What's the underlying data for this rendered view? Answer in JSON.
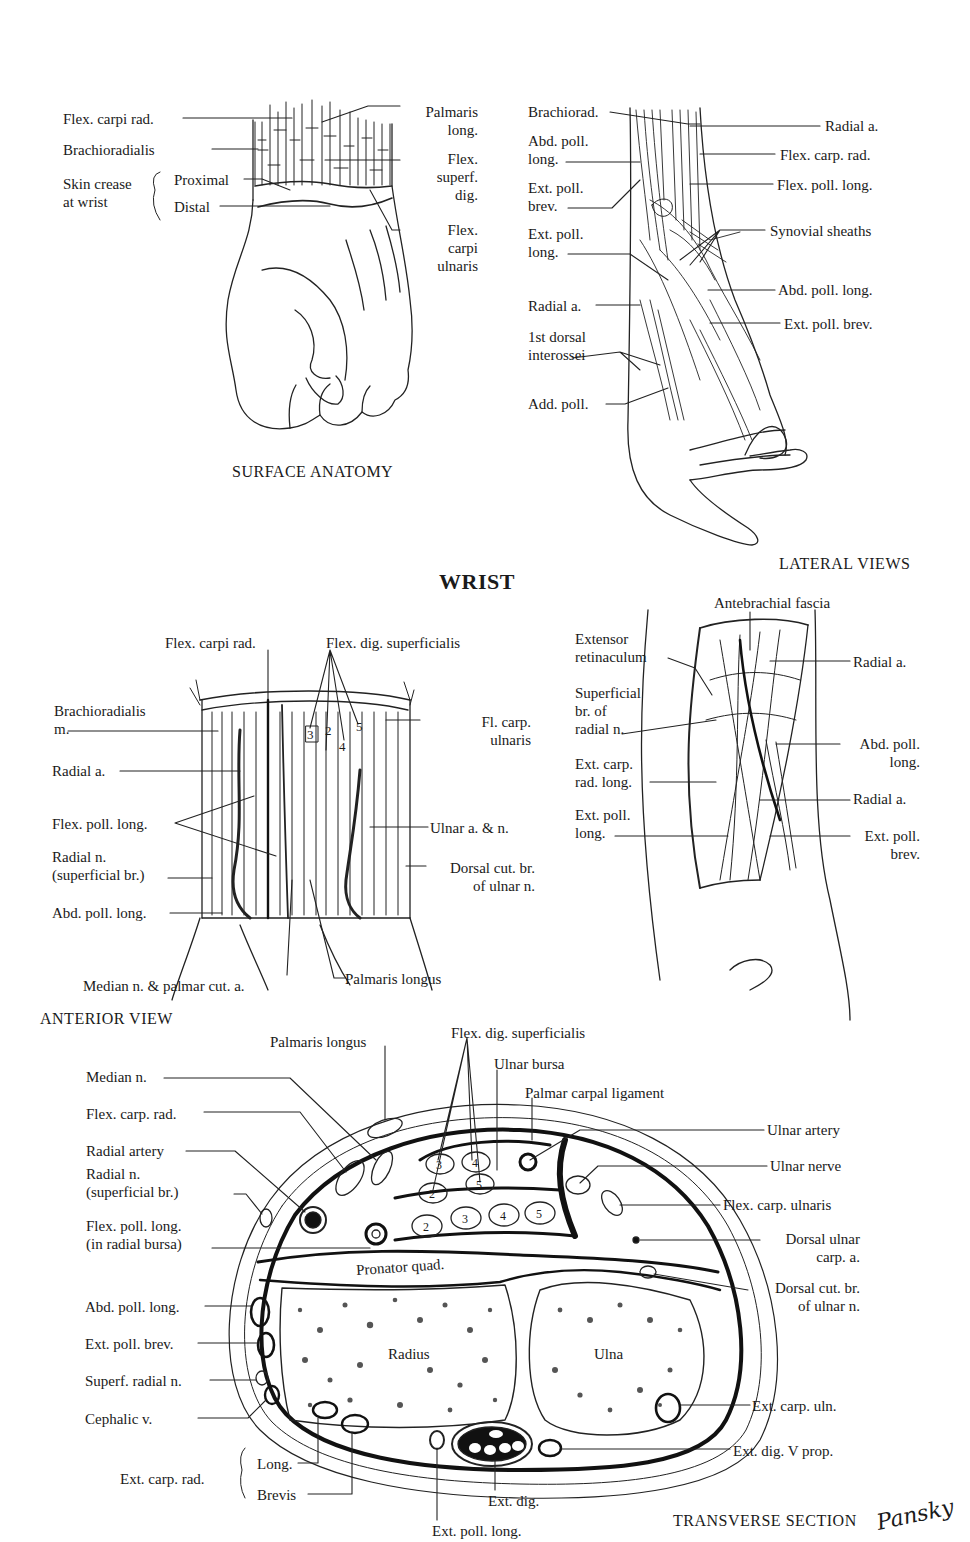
{
  "title": "WRIST",
  "panels": {
    "surface_anatomy": {
      "caption": "SURFACE ANATOMY",
      "labels": [
        {
          "id": "flex-carpi-rad",
          "text": "Flex. carpi rad.",
          "x": 63,
          "y": 110,
          "align": "left"
        },
        {
          "id": "brachioradialis",
          "text": "Brachioradialis",
          "x": 63,
          "y": 141,
          "align": "left"
        },
        {
          "id": "skin-crease",
          "text": "Skin crease\nat wrist",
          "x": 63,
          "y": 175,
          "align": "left"
        },
        {
          "id": "proximal",
          "text": "Proximal",
          "x": 174,
          "y": 171,
          "align": "left"
        },
        {
          "id": "distal",
          "text": "Distal",
          "x": 174,
          "y": 198,
          "align": "left"
        },
        {
          "id": "palmaris-long",
          "text": "Palmaris\nlong.",
          "x": 402,
          "y": 103,
          "align": "right",
          "w": 76
        },
        {
          "id": "flex-superf-dig",
          "text": "Flex.\nsuperf.\ndig.",
          "x": 402,
          "y": 150,
          "align": "right",
          "w": 76
        },
        {
          "id": "flex-carpi-ulnaris",
          "text": "Flex.\ncarpi\nulnaris",
          "x": 402,
          "y": 221,
          "align": "right",
          "w": 76
        }
      ]
    },
    "lateral_views": {
      "caption": "LATERAL VIEWS",
      "upper_labels": [
        {
          "id": "brachiorad",
          "text": "Brachiorad.",
          "x": 528,
          "y": 103,
          "align": "left"
        },
        {
          "id": "abd-poll-long-1",
          "text": "Abd. poll.\nlong.",
          "x": 528,
          "y": 132,
          "align": "left"
        },
        {
          "id": "ext-poll-brev-1",
          "text": "Ext. poll.\nbrev.",
          "x": 528,
          "y": 179,
          "align": "left"
        },
        {
          "id": "ext-poll-long-1",
          "text": "Ext. poll.\nlong.",
          "x": 528,
          "y": 225,
          "align": "left"
        },
        {
          "id": "radial-a-left",
          "text": "Radial a.",
          "x": 528,
          "y": 297,
          "align": "left"
        },
        {
          "id": "first-dorsal-interossei",
          "text": "1st dorsal\ninterossei",
          "x": 528,
          "y": 328,
          "align": "left"
        },
        {
          "id": "add-poll",
          "text": "Add. poll.",
          "x": 528,
          "y": 395,
          "align": "left"
        },
        {
          "id": "radial-a-right",
          "text": "Radial a.",
          "x": 825,
          "y": 117,
          "align": "left"
        },
        {
          "id": "flex-carp-rad-1",
          "text": "Flex. carp. rad.",
          "x": 780,
          "y": 146,
          "align": "left"
        },
        {
          "id": "flex-poll-long-1",
          "text": "Flex. poll. long.",
          "x": 777,
          "y": 176,
          "align": "left"
        },
        {
          "id": "synovial-sheaths",
          "text": "Synovial sheaths",
          "x": 770,
          "y": 222,
          "align": "left"
        },
        {
          "id": "abd-poll-long-2",
          "text": "Abd. poll. long.",
          "x": 778,
          "y": 281,
          "align": "left"
        },
        {
          "id": "ext-poll-brev-2",
          "text": "Ext. poll. brev.",
          "x": 784,
          "y": 315,
          "align": "left"
        }
      ],
      "lower_labels": [
        {
          "id": "antebrachial-fascia",
          "text": "Antebrachial fascia",
          "x": 714,
          "y": 594,
          "align": "left"
        },
        {
          "id": "extensor-retinaculum",
          "text": "Extensor\nretinaculum",
          "x": 575,
          "y": 630,
          "align": "left"
        },
        {
          "id": "superficial-br-radial-n",
          "text": "Superficial\nbr. of\nradial n.",
          "x": 575,
          "y": 684,
          "align": "left"
        },
        {
          "id": "ext-carp-rad-long",
          "text": "Ext. carp.\nrad. long.",
          "x": 575,
          "y": 755,
          "align": "left"
        },
        {
          "id": "ext-poll-long-2",
          "text": "Ext. poll.\nlong.",
          "x": 575,
          "y": 806,
          "align": "left"
        },
        {
          "id": "radial-a-3",
          "text": "Radial a.",
          "x": 853,
          "y": 653,
          "align": "left"
        },
        {
          "id": "abd-poll-long-3",
          "text": "Abd. poll.\nlong.",
          "x": 840,
          "y": 735,
          "align": "right",
          "w": 80
        },
        {
          "id": "radial-a-4",
          "text": "Radial a.",
          "x": 853,
          "y": 790,
          "align": "left"
        },
        {
          "id": "ext-poll-brev-3",
          "text": "Ext. poll.\nbrev.",
          "x": 840,
          "y": 827,
          "align": "right",
          "w": 80
        }
      ]
    },
    "anterior_view": {
      "caption": "ANTERIOR VIEW",
      "tendon_numbers": [
        "3",
        "2",
        "4",
        "5"
      ],
      "labels": [
        {
          "id": "flex-carpi-rad-2",
          "text": "Flex. carpi rad.",
          "x": 165,
          "y": 634,
          "align": "left"
        },
        {
          "id": "flex-dig-superficialis",
          "text": "Flex. dig. superficialis",
          "x": 326,
          "y": 634,
          "align": "left"
        },
        {
          "id": "brachioradialis-m",
          "text": "Brachioradialis\nm.",
          "x": 54,
          "y": 702,
          "align": "left"
        },
        {
          "id": "radial-a-5",
          "text": "Radial a.",
          "x": 52,
          "y": 762,
          "align": "left"
        },
        {
          "id": "flex-poll-long-2",
          "text": "Flex. poll. long.",
          "x": 52,
          "y": 815,
          "align": "left"
        },
        {
          "id": "radial-n-superficial",
          "text": "Radial n.\n(superficial br.)",
          "x": 52,
          "y": 848,
          "align": "left"
        },
        {
          "id": "abd-poll-long-4",
          "text": "Abd. poll. long.",
          "x": 52,
          "y": 904,
          "align": "left"
        },
        {
          "id": "median-n-palmar",
          "text": "Median n. & palmar cut. a.",
          "x": 83,
          "y": 977,
          "align": "left"
        },
        {
          "id": "palmaris-longus",
          "text": "Palmaris longus",
          "x": 345,
          "y": 970,
          "align": "left"
        },
        {
          "id": "fl-carp-ulnaris",
          "text": "Fl. carp.\nulnaris",
          "x": 455,
          "y": 713,
          "align": "right",
          "w": 76
        },
        {
          "id": "ulnar-a-n",
          "text": "Ulnar a. & n.",
          "x": 430,
          "y": 819,
          "align": "left"
        },
        {
          "id": "dorsal-cut-br-ulnar-1",
          "text": "Dorsal cut. br.\nof ulnar n.",
          "x": 420,
          "y": 859,
          "align": "right",
          "w": 115
        }
      ]
    },
    "transverse_section": {
      "caption": "TRANSVERSE SECTION",
      "signature": "Pansky",
      "bone_labels": {
        "pronator": "Pronator quad.",
        "radius": "Radius",
        "ulna": "Ulna"
      },
      "tendon_numbers_upper": [
        "3",
        "4",
        "2",
        "5"
      ],
      "tendon_numbers_lower": [
        "2",
        "3",
        "4",
        "5"
      ],
      "labels": [
        {
          "id": "palmaris-longus-2",
          "text": "Palmaris longus",
          "x": 270,
          "y": 1033,
          "align": "left"
        },
        {
          "id": "flex-dig-superficialis-2",
          "text": "Flex. dig. superficialis",
          "x": 451,
          "y": 1024,
          "align": "left"
        },
        {
          "id": "ulnar-bursa",
          "text": "Ulnar bursa",
          "x": 494,
          "y": 1055,
          "align": "left"
        },
        {
          "id": "palmar-carpal-ligament",
          "text": "Palmar carpal ligament",
          "x": 525,
          "y": 1084,
          "align": "left"
        },
        {
          "id": "median-n",
          "text": "Median n.",
          "x": 86,
          "y": 1068,
          "align": "left"
        },
        {
          "id": "flex-carp-rad-3",
          "text": "Flex. carp. rad.",
          "x": 86,
          "y": 1105,
          "align": "left"
        },
        {
          "id": "radial-artery",
          "text": "Radial artery",
          "x": 86,
          "y": 1142,
          "align": "left"
        },
        {
          "id": "radial-n-superficial-2",
          "text": "Radial n.\n(superficial br.)",
          "x": 86,
          "y": 1165,
          "align": "left"
        },
        {
          "id": "flex-poll-long-radial-bursa",
          "text": "Flex. poll. long.\n(in radial bursa)",
          "x": 86,
          "y": 1217,
          "align": "left"
        },
        {
          "id": "abd-poll-long-5",
          "text": "Abd. poll. long.",
          "x": 85,
          "y": 1298,
          "align": "left"
        },
        {
          "id": "ext-poll-brev-4",
          "text": "Ext. poll. brev.",
          "x": 85,
          "y": 1335,
          "align": "left"
        },
        {
          "id": "superf-radial-n",
          "text": "Superf. radial n.",
          "x": 85,
          "y": 1372,
          "align": "left"
        },
        {
          "id": "cephalic-v",
          "text": "Cephalic v.",
          "x": 85,
          "y": 1410,
          "align": "left"
        },
        {
          "id": "ext-carp-rad",
          "text": "Ext. carp. rad.",
          "x": 120,
          "y": 1470,
          "align": "left"
        },
        {
          "id": "long",
          "text": "Long.",
          "x": 257,
          "y": 1455,
          "align": "left"
        },
        {
          "id": "brevis",
          "text": "Brevis",
          "x": 257,
          "y": 1486,
          "align": "left"
        },
        {
          "id": "ext-poll-long-3",
          "text": "Ext. poll. long.",
          "x": 432,
          "y": 1522,
          "align": "left"
        },
        {
          "id": "ext-dig",
          "text": "Ext. dig.",
          "x": 488,
          "y": 1492,
          "align": "left"
        },
        {
          "id": "ulnar-artery",
          "text": "Ulnar artery",
          "x": 767,
          "y": 1121,
          "align": "left"
        },
        {
          "id": "ulnar-nerve",
          "text": "Ulnar nerve",
          "x": 770,
          "y": 1157,
          "align": "left"
        },
        {
          "id": "flex-carp-ulnaris-2",
          "text": "Flex. carp. ulnaris",
          "x": 723,
          "y": 1196,
          "align": "left"
        },
        {
          "id": "dorsal-ulnar-carp-a",
          "text": "Dorsal ulnar\ncarp. a.",
          "x": 750,
          "y": 1230,
          "align": "right",
          "w": 110
        },
        {
          "id": "dorsal-cut-br-ulnar-2",
          "text": "Dorsal cut. br.\nof ulnar n.",
          "x": 740,
          "y": 1279,
          "align": "right",
          "w": 120
        },
        {
          "id": "ext-carp-uln",
          "text": "Ext. carp. uln.",
          "x": 752,
          "y": 1397,
          "align": "left"
        },
        {
          "id": "ext-dig-v-prop",
          "text": "Ext. dig. V prop.",
          "x": 733,
          "y": 1442,
          "align": "left"
        }
      ]
    }
  }
}
